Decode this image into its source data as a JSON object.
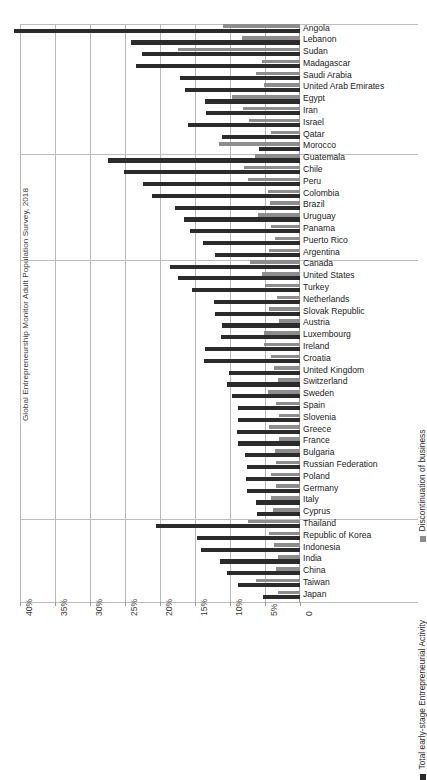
{
  "chart_data": {
    "type": "bar",
    "orientation": "horizontal-rtl",
    "title": "",
    "xlabel": "",
    "ylabel": "Global Entrepreneurship Monitor Adult Population Survey, 2018",
    "xlim": [
      0,
      40
    ],
    "xticks": [
      "40%",
      "35%",
      "30%",
      "25%",
      "20%",
      "15%",
      "10%",
      "5%",
      "0"
    ],
    "xtick_values": [
      40,
      35,
      30,
      25,
      20,
      15,
      10,
      5,
      0
    ],
    "grid": true,
    "axis_direction": "zero at right, values increase leftward",
    "legend": {
      "position": "right-rotated",
      "entries": [
        {
          "name": "Discontinuation of business",
          "color": "#8d8d8d"
        },
        {
          "name": "Total early-stage Entrepreneurial Activity",
          "color": "#2b2b2b"
        }
      ]
    },
    "series": [
      {
        "name": "Discontinuation of business",
        "color": "#8d8d8d"
      },
      {
        "name": "Total early-stage Entrepreneurial Activity",
        "color": "#2b2b2b"
      }
    ],
    "group_separators_after": [
      "Morocco",
      "Argentina",
      "Cyprus"
    ],
    "categories": [
      "Angola",
      "Lebanon",
      "Sudan",
      "Madagascar",
      "Saudi Arabia",
      "United Arab Emirates",
      "Egypt",
      "Iran",
      "Israel",
      "Qatar",
      "Morocco",
      "Guatemala",
      "Chile",
      "Peru",
      "Colombia",
      "Brazil",
      "Uruguay",
      "Panama",
      "Puerto Rico",
      "Argentina",
      "Canada",
      "United States",
      "Turkey",
      "Netherlands",
      "Slovak Republic",
      "Austria",
      "Luxembourg",
      "Ireland",
      "Croatia",
      "United Kingdom",
      "Switzerland",
      "Sweden",
      "Spain",
      "Slovenia",
      "Greece",
      "France",
      "Bulgaria",
      "Russian Federation",
      "Poland",
      "Germany",
      "Italy",
      "Cyprus",
      "Thailand",
      "Republic of Korea",
      "Indonesia",
      "India",
      "China",
      "Taiwan",
      "Japan"
    ],
    "rows": [
      {
        "country": "Angola",
        "tea": 40.8,
        "discontinuation": 11.0
      },
      {
        "country": "Lebanon",
        "tea": 24.1,
        "discontinuation": 8.3
      },
      {
        "country": "Sudan",
        "tea": 22.6,
        "discontinuation": 17.5
      },
      {
        "country": "Madagascar",
        "tea": 23.5,
        "discontinuation": 5.5
      },
      {
        "country": "Saudi Arabia",
        "tea": 17.1,
        "discontinuation": 6.3
      },
      {
        "country": "United Arab Emirates",
        "tea": 16.5,
        "discontinuation": 5.1
      },
      {
        "country": "Egypt",
        "tea": 13.6,
        "discontinuation": 9.7
      },
      {
        "country": "Iran",
        "tea": 13.5,
        "discontinuation": 8.1
      },
      {
        "country": "Israel",
        "tea": 16.0,
        "discontinuation": 7.3
      },
      {
        "country": "Qatar",
        "tea": 11.2,
        "discontinuation": 4.1
      },
      {
        "country": "Morocco",
        "tea": 5.8,
        "discontinuation": 11.6
      },
      {
        "country": "Guatemala",
        "tea": 27.5,
        "discontinuation": 6.4
      },
      {
        "country": "Chile",
        "tea": 25.1,
        "discontinuation": 8.0
      },
      {
        "country": "Peru",
        "tea": 22.4,
        "discontinuation": 7.5
      },
      {
        "country": "Colombia",
        "tea": 21.2,
        "discontinuation": 4.6
      },
      {
        "country": "Brazil",
        "tea": 17.9,
        "discontinuation": 4.3
      },
      {
        "country": "Uruguay",
        "tea": 16.6,
        "discontinuation": 6.0
      },
      {
        "country": "Panama",
        "tea": 15.7,
        "discontinuation": 4.1
      },
      {
        "country": "Puerto Rico",
        "tea": 13.8,
        "discontinuation": 3.6
      },
      {
        "country": "Argentina",
        "tea": 12.1,
        "discontinuation": 4.5
      },
      {
        "country": "Canada",
        "tea": 18.6,
        "discontinuation": 7.2
      },
      {
        "country": "United States",
        "tea": 17.4,
        "discontinuation": 5.4
      },
      {
        "country": "Turkey",
        "tea": 15.5,
        "discontinuation": 5.0
      },
      {
        "country": "Netherlands",
        "tea": 12.3,
        "discontinuation": 3.3
      },
      {
        "country": "Slovak Republic",
        "tea": 12.2,
        "discontinuation": 4.4
      },
      {
        "country": "Austria",
        "tea": 11.2,
        "discontinuation": 3.0
      },
      {
        "country": "Luxembourg",
        "tea": 11.3,
        "discontinuation": 5.2
      },
      {
        "country": "Ireland",
        "tea": 13.6,
        "discontinuation": 5.1
      },
      {
        "country": "Croatia",
        "tea": 13.7,
        "discontinuation": 4.2
      },
      {
        "country": "United Kingdom",
        "tea": 10.1,
        "discontinuation": 3.7
      },
      {
        "country": "Switzerland",
        "tea": 10.5,
        "discontinuation": 3.2
      },
      {
        "country": "Sweden",
        "tea": 9.7,
        "discontinuation": 4.6
      },
      {
        "country": "Spain",
        "tea": 8.9,
        "discontinuation": 3.5
      },
      {
        "country": "Slovenia",
        "tea": 8.9,
        "discontinuation": 3.0
      },
      {
        "country": "Greece",
        "tea": 9.0,
        "discontinuation": 4.4
      },
      {
        "country": "France",
        "tea": 8.9,
        "discontinuation": 3.0
      },
      {
        "country": "Bulgaria",
        "tea": 7.8,
        "discontinuation": 3.6
      },
      {
        "country": "Russian Federation",
        "tea": 7.6,
        "discontinuation": 3.5
      },
      {
        "country": "Poland",
        "tea": 7.7,
        "discontinuation": 4.1
      },
      {
        "country": "Germany",
        "tea": 7.6,
        "discontinuation": 3.4
      },
      {
        "country": "Italy",
        "tea": 6.3,
        "discontinuation": 4.1
      },
      {
        "country": "Cyprus",
        "tea": 6.2,
        "discontinuation": 3.9
      },
      {
        "country": "Thailand",
        "tea": 20.6,
        "discontinuation": 7.5
      },
      {
        "country": "Republic of Korea",
        "tea": 14.7,
        "discontinuation": 4.4
      },
      {
        "country": "Indonesia",
        "tea": 14.1,
        "discontinuation": 3.7
      },
      {
        "country": "India",
        "tea": 11.4,
        "discontinuation": 3.1
      },
      {
        "country": "China",
        "tea": 10.4,
        "discontinuation": 3.4
      },
      {
        "country": "Taiwan",
        "tea": 8.9,
        "discontinuation": 6.3
      },
      {
        "country": "Japan",
        "tea": 5.3,
        "discontinuation": 3.1
      }
    ]
  }
}
